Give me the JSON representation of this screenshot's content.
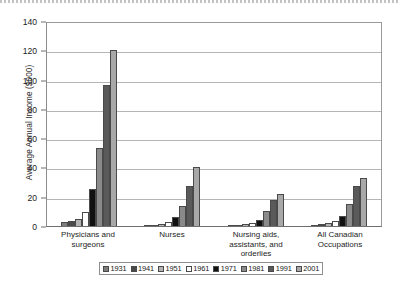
{
  "chart_data": {
    "type": "bar",
    "title": "",
    "xlabel": "",
    "ylabel": "Average Annual Income ($000)",
    "ylim": [
      0,
      140
    ],
    "yticks": [
      0,
      20,
      40,
      60,
      80,
      100,
      120,
      140
    ],
    "grid": true,
    "legend_position": "bottom",
    "categories": [
      "Physicians and surgeons",
      "Nurses",
      "Nursing aids, assistants, and orderlies",
      "All Canadian Occupations"
    ],
    "series": [
      {
        "name": "1931",
        "color": "#7d7d7d",
        "values": [
          3.0,
          0.8,
          0.5,
          0.9
        ]
      },
      {
        "name": "1941",
        "color": "#4a4a4a",
        "values": [
          3.6,
          1.0,
          0.7,
          1.1
        ]
      },
      {
        "name": "1951",
        "color": "#b3b3b3",
        "values": [
          4.8,
          1.6,
          1.1,
          1.8
        ]
      },
      {
        "name": "1961",
        "color": "#ffffff",
        "values": [
          9.5,
          3.0,
          2.0,
          3.2
        ]
      },
      {
        "name": "1971",
        "color": "#111111",
        "values": [
          25.0,
          6.0,
          4.0,
          7.0
        ]
      },
      {
        "name": "1981",
        "color": "#8a8a8a",
        "values": [
          53.0,
          14.0,
          10.0,
          15.0
        ]
      },
      {
        "name": "1991",
        "color": "#5a5a5a",
        "values": [
          96.0,
          27.0,
          18.0,
          27.0
        ]
      },
      {
        "name": "2001",
        "color": "#a8a8a8",
        "values": [
          120.0,
          40.0,
          22.0,
          33.0
        ]
      }
    ]
  },
  "legend": {
    "items": [
      {
        "label": "1931"
      },
      {
        "label": "1941"
      },
      {
        "label": "1951"
      },
      {
        "label": "1961"
      },
      {
        "label": "1971"
      },
      {
        "label": "1981"
      },
      {
        "label": "1991"
      },
      {
        "label": "2001"
      }
    ]
  }
}
